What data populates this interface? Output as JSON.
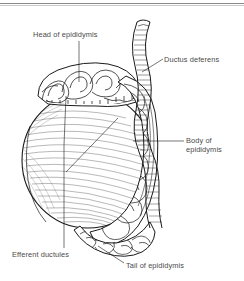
{
  "figure": {
    "type": "anatomical-line-drawing",
    "background_color": "#ffffff",
    "ink_color": "#1a1a1a",
    "label_color": "#4a4a4a",
    "rule_color": "#8a8a8a"
  },
  "labels": {
    "head": "Head of epididymis",
    "ductus": "Ductus deferens",
    "body_line1": "Body of",
    "body_line2": "epididymis",
    "efferent": "Efferent ductules",
    "tail": "Tail of epididymis"
  },
  "structures": [
    {
      "name": "testis",
      "description": "large ovoid body with fine radiating hatching"
    },
    {
      "name": "head-of-epididymis",
      "description": "convoluted tubular mass on superior pole"
    },
    {
      "name": "body-of-epididymis",
      "description": "coiled tubule column along posterior border"
    },
    {
      "name": "tail-of-epididymis",
      "description": "coiled mass curving beneath inferior pole"
    },
    {
      "name": "ductus-deferens",
      "description": "wavy cut tube ascending from the tail"
    },
    {
      "name": "efferent-ductules",
      "description": "ductules between testis and head of epididymis"
    }
  ]
}
